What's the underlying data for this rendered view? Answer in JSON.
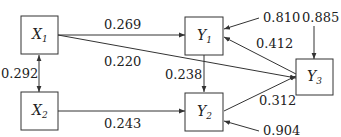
{
  "nodes": {
    "x1": {
      "name": "X",
      "sub": "1"
    },
    "x2": {
      "name": "X",
      "sub": "2"
    },
    "y1": {
      "name": "Y",
      "sub": "1"
    },
    "y2": {
      "name": "Y",
      "sub": "2"
    },
    "y3": {
      "name": "Y",
      "sub": "3"
    }
  },
  "edges": {
    "x1_y1": "0.269",
    "x1_y3": "0.220",
    "x1_x2": "0.292",
    "x2_y2": "0.243",
    "y1_y2": "0.238",
    "y3_y1": "0.412",
    "y2_y3": "0.312",
    "err_y1": "0.810",
    "err_y3": "0.885",
    "err_y2": "0.904"
  }
}
